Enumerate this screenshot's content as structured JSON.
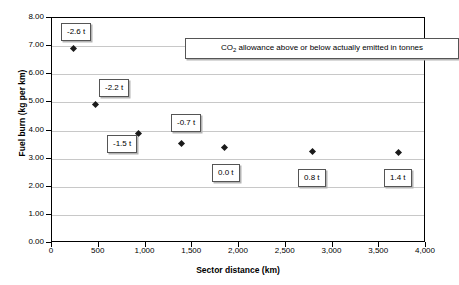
{
  "chart_data": {
    "type": "scatter",
    "title": "",
    "xlabel": "Sector distance (km)",
    "ylabel": "Fuel burn (kg per km)",
    "xlim": [
      0,
      4000
    ],
    "ylim": [
      0,
      8
    ],
    "grid": "horizontal",
    "legend_position": "inside-top",
    "x_tick_labels": [
      "0",
      "500",
      "1,000",
      "1,500",
      "2,000",
      "2,500",
      "3,000",
      "3,500",
      "4,000"
    ],
    "x_tick_values": [
      0,
      500,
      1000,
      1500,
      2000,
      2500,
      3000,
      3500,
      4000
    ],
    "y_tick_labels": [
      "0.00",
      "1.00",
      "2.00",
      "3.00",
      "4.00",
      "5.00",
      "6.00",
      "7.00",
      "8.00"
    ],
    "y_tick_values": [
      0,
      1,
      2,
      3,
      4,
      5,
      6,
      7,
      8
    ],
    "series": [
      {
        "name": "Fuel burn",
        "marker": "diamond",
        "color": "#1a1a1a",
        "x": [
          230,
          465,
          925,
          1385,
          1850,
          2785,
          3710
        ],
        "y": [
          6.93,
          4.91,
          3.88,
          3.55,
          3.38,
          3.27,
          3.22
        ]
      }
    ],
    "annotations": [
      {
        "text": "-2.6 t",
        "x": 230,
        "y": 6.93,
        "box_left_px": 60,
        "box_top_px": 22
      },
      {
        "text": "-2.2 t",
        "x": 465,
        "y": 4.91,
        "box_left_px": 98,
        "box_top_px": 78
      },
      {
        "text": "-1.5 t",
        "x": 925,
        "y": 3.88,
        "box_left_px": 106,
        "box_top_px": 134
      },
      {
        "text": "-0.7 t",
        "x": 1385,
        "y": 3.55,
        "box_left_px": 170,
        "box_top_px": 113
      },
      {
        "text": "0.0 t",
        "x": 1850,
        "y": 3.38,
        "box_left_px": 211,
        "box_top_px": 163
      },
      {
        "text": "0.8 t",
        "x": 2785,
        "y": 3.27,
        "box_left_px": 297,
        "box_top_px": 168
      },
      {
        "text": "1.4 t",
        "x": 3710,
        "y": 3.22,
        "box_left_px": 383,
        "box_top_px": 168
      }
    ],
    "legend_text_prefix": "CO",
    "legend_text_sub": "2",
    "legend_text_suffix": " allowance above or below actually emitted in tonnes",
    "legend_text_full": "CO2 allowance above or below actually emitted in tonnes"
  }
}
